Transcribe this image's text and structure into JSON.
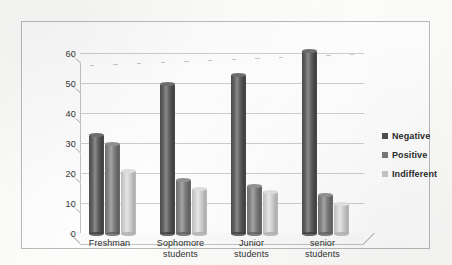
{
  "chart_data": {
    "type": "bar",
    "title": "",
    "subtitle": "",
    "xlabel": "",
    "ylabel": "",
    "ylim": [
      0,
      60
    ],
    "y_ticks": [
      0,
      10,
      20,
      30,
      40,
      50,
      60
    ],
    "grid": true,
    "legend_position": "right",
    "categories": [
      "Freshman",
      "Sophomore students",
      "Junior students",
      "senior students"
    ],
    "category_lines": [
      [
        "Freshman"
      ],
      [
        "Sophomore",
        "students"
      ],
      [
        "Junior",
        "students"
      ],
      [
        "senior",
        "students"
      ]
    ],
    "series": [
      {
        "name": "Negative",
        "color": "#4d4d4d",
        "values": [
          33,
          50,
          53,
          61
        ]
      },
      {
        "name": "Positive",
        "color": "#7a7a7a",
        "values": [
          30,
          18,
          16,
          13
        ]
      },
      {
        "name": "Indifferent",
        "color": "#c8c8c8",
        "values": [
          21,
          15,
          14,
          10
        ]
      }
    ]
  },
  "legend": {
    "items": [
      {
        "label": "Negative"
      },
      {
        "label": "Positive"
      },
      {
        "label": "Indifferent"
      }
    ]
  },
  "colors": {
    "series_negative": "#4d4d4d",
    "series_positive": "#7a7a7a",
    "series_indifferent": "#c8c8c8",
    "gridline": "#cfcfcf",
    "frame_border": "#b9b9b9",
    "page_background": "#fdfdfc",
    "text": "#2f2f2f"
  }
}
